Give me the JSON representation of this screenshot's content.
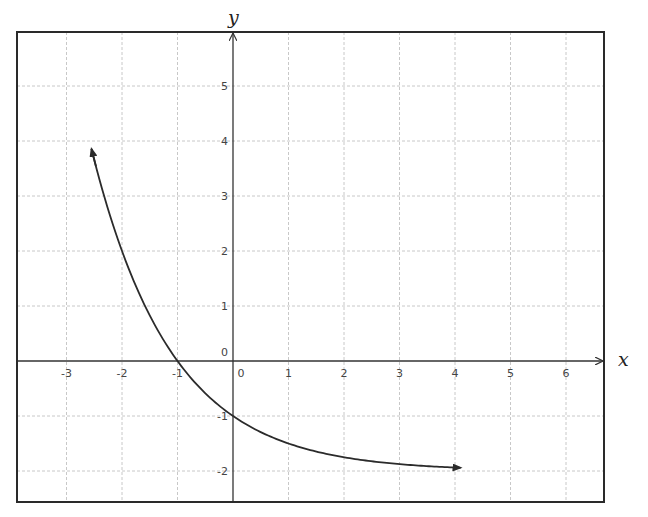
{
  "chart_data": {
    "type": "line",
    "title": "",
    "xlabel": "x",
    "ylabel": "y",
    "xlim": [
      -3.9,
      6.6
    ],
    "ylim": [
      -2.55,
      5.9
    ],
    "grid": true,
    "x_ticks": [
      -3,
      -2,
      -1,
      0,
      1,
      2,
      3,
      4,
      5,
      6
    ],
    "x_tick_labels": [
      "-3",
      "-2",
      "-1",
      "0",
      "1",
      "2",
      "3",
      "4",
      "5",
      "6"
    ],
    "y_ticks": [
      -2,
      -1,
      0,
      1,
      2,
      3,
      4,
      5
    ],
    "y_tick_labels": [
      "-2",
      "-1",
      "0",
      "1",
      "2",
      "3",
      "4",
      "5"
    ],
    "origin_label": "0",
    "series": [
      {
        "name": "y = 2^(-x) - 2",
        "function": "2^(-x) - 2",
        "x_range": [
          -2.55,
          4.1
        ],
        "arrows": "both",
        "points": [
          [
            -2.55,
            3.86
          ],
          [
            -2.5,
            3.66
          ],
          [
            -2.25,
            2.76
          ],
          [
            -2,
            2
          ],
          [
            -1.75,
            1.36
          ],
          [
            -1.5,
            0.83
          ],
          [
            -1.25,
            0.38
          ],
          [
            -1,
            0
          ],
          [
            -0.75,
            -0.32
          ],
          [
            -0.5,
            -0.59
          ],
          [
            -0.25,
            -0.81
          ],
          [
            0,
            -1
          ],
          [
            0.5,
            -1.29
          ],
          [
            1,
            -1.5
          ],
          [
            1.5,
            -1.65
          ],
          [
            2,
            -1.75
          ],
          [
            2.5,
            -1.82
          ],
          [
            3,
            -1.88
          ],
          [
            3.5,
            -1.91
          ],
          [
            4,
            -1.94
          ],
          [
            4.1,
            -1.94
          ]
        ],
        "key_points": [
          {
            "x": -2,
            "y": 2
          },
          {
            "x": -1,
            "y": 0
          },
          {
            "x": 0,
            "y": -1
          }
        ],
        "horizontal_asymptote": -2
      }
    ]
  },
  "colors": {
    "grid": "#c8c8c8",
    "frame": "#2a2a2a",
    "curve": "#2b2b2b",
    "text": "#444444"
  }
}
